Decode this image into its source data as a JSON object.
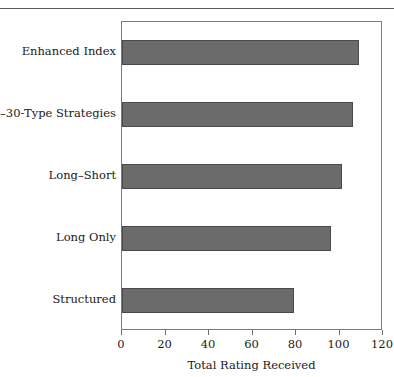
{
  "figure": {
    "top_rule_color": "#5a5a5a"
  },
  "chart_data": {
    "type": "bar",
    "orientation": "horizontal",
    "title": "",
    "subtitle": "",
    "xlabel": "Total Rating Received",
    "ylabel": "",
    "categories": [
      "Enhanced Index",
      "130–30-Type Strategies",
      "Long–Short",
      "Long Only",
      "Structured"
    ],
    "values": [
      109,
      106,
      101,
      96,
      79
    ],
    "xlim": [
      0,
      120
    ],
    "xticks": [
      0,
      20,
      40,
      60,
      80,
      100,
      120
    ],
    "xtick_labels": [
      "0",
      "20",
      "40",
      "60",
      "80",
      "100",
      "120"
    ],
    "grid": false,
    "legend": null,
    "bar_color": "#6b6b6b",
    "bar_edge_color": "#4a4a4a",
    "frame_color": "#7a7a7a",
    "background": "#ffffff"
  }
}
